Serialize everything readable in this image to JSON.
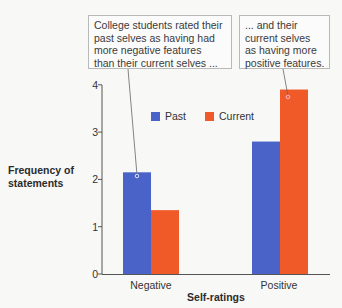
{
  "callouts": {
    "left": "College students rated their\npast selves as having had\nmore negative features\nthan their current selves ...",
    "right": "... and their\ncurrent selves\nas having more\npositive features."
  },
  "colors": {
    "past": "#4a63c9",
    "current": "#f05a28",
    "axis": "#555555",
    "leader": "#666666"
  },
  "chart_data": {
    "type": "bar",
    "title": "",
    "xlabel": "Self-ratings",
    "ylabel": "Frequency of statements",
    "categories": [
      "Negative",
      "Positive"
    ],
    "series": [
      {
        "name": "Past",
        "values": [
          2.15,
          2.8
        ]
      },
      {
        "name": "Current",
        "values": [
          1.35,
          3.9
        ]
      }
    ],
    "ylim": [
      0,
      4
    ],
    "yticks": [
      "0",
      "1",
      "2",
      "3",
      "4"
    ],
    "legend": [
      "Past",
      "Current"
    ],
    "legend_position": "upper center",
    "grid": false,
    "annotations": [
      "College students rated their past selves as having had more negative features than their current selves ...",
      "... and their current selves as having more positive features."
    ]
  },
  "axis": {
    "ylabel": "Frequency of\nstatements",
    "xlabel": "Self-ratings",
    "yticks": [
      "0",
      "1",
      "2",
      "3",
      "4"
    ],
    "categories": [
      "Negative",
      "Positive"
    ]
  },
  "legend": {
    "past": "Past",
    "current": "Current"
  }
}
